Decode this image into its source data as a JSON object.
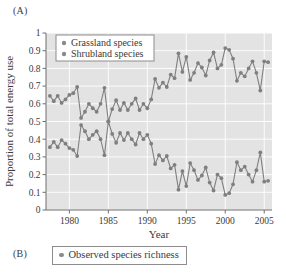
{
  "panels": {
    "a_label": "(A)",
    "b_label": "(B)"
  },
  "panel_b": {
    "legend": [
      {
        "label": "Observed species richness",
        "color": "#8a8a8a",
        "marker": "circle"
      }
    ]
  },
  "colors": {
    "series": "#7f7f7f",
    "plot_background": "#e3e3e3",
    "gridline": "#ffffff",
    "axis": "#6e6e6e",
    "text": "#3a3a3a",
    "legend_border": "#8d8d8d",
    "legend_background": "#ffffff"
  },
  "chart_data": {
    "type": "line",
    "title": "",
    "xlabel": "Year",
    "ylabel": "Proportion of total energy use",
    "xlim": [
      1977,
      2006
    ],
    "ylim": [
      0,
      1
    ],
    "xticks": [
      1980,
      1985,
      1990,
      1995,
      2000,
      2005
    ],
    "xticklabels": [
      "1980",
      "1985",
      "1990",
      "1995",
      "2000",
      "2005"
    ],
    "yticks": [
      0,
      0.1,
      0.2,
      0.3,
      0.4,
      0.5,
      0.6,
      0.7,
      0.8,
      0.9,
      1
    ],
    "yticklabels": [
      "0",
      "0.1",
      "0.2",
      "0.3",
      "0.4",
      "0.5",
      "0.6",
      "0.7",
      "0.8",
      "0.9",
      "1"
    ],
    "grid": true,
    "legend_position": "upper-left",
    "markers": "circle",
    "x": [
      1977.5,
      1978,
      1978.5,
      1979,
      1979.5,
      1980,
      1980.5,
      1981,
      1981.5,
      1982,
      1982.5,
      1983,
      1983.5,
      1984,
      1984.5,
      1985,
      1985.5,
      1986,
      1986.5,
      1987,
      1987.5,
      1988,
      1988.5,
      1989,
      1989.5,
      1990,
      1990.5,
      1991,
      1991.5,
      1992,
      1992.5,
      1993,
      1993.5,
      1994,
      1994.5,
      1995,
      1995.5,
      1996,
      1996.5,
      1997,
      1997.5,
      1998,
      1998.5,
      1999,
      1999.5,
      2000,
      2000.5,
      2001,
      2001.5,
      2002,
      2002.5,
      2003,
      2003.5,
      2004,
      2004.5,
      2005,
      2005.5
    ],
    "series": [
      {
        "name": "Grassland species",
        "color": "#7f7f7f",
        "values": [
          0.645,
          0.615,
          0.645,
          0.605,
          0.625,
          0.65,
          0.66,
          0.695,
          0.52,
          0.555,
          0.6,
          0.575,
          0.555,
          0.6,
          0.69,
          0.5,
          0.57,
          0.62,
          0.565,
          0.605,
          0.565,
          0.6,
          0.63,
          0.565,
          0.6,
          0.575,
          0.625,
          0.74,
          0.69,
          0.72,
          0.695,
          0.765,
          0.745,
          0.885,
          0.78,
          0.865,
          0.735,
          0.775,
          0.83,
          0.805,
          0.76,
          0.845,
          0.89,
          0.8,
          0.82,
          0.915,
          0.905,
          0.855,
          0.73,
          0.775,
          0.755,
          0.8,
          0.84,
          0.775,
          0.675,
          0.84,
          0.835
        ]
      },
      {
        "name": "Shrubland species",
        "color": "#7f7f7f",
        "values": [
          0.355,
          0.385,
          0.355,
          0.395,
          0.375,
          0.35,
          0.34,
          0.305,
          0.48,
          0.445,
          0.4,
          0.425,
          0.445,
          0.4,
          0.31,
          0.5,
          0.43,
          0.38,
          0.435,
          0.395,
          0.435,
          0.4,
          0.37,
          0.435,
          0.4,
          0.425,
          0.375,
          0.26,
          0.31,
          0.28,
          0.305,
          0.235,
          0.255,
          0.115,
          0.22,
          0.135,
          0.265,
          0.225,
          0.17,
          0.195,
          0.24,
          0.155,
          0.11,
          0.2,
          0.18,
          0.085,
          0.095,
          0.145,
          0.27,
          0.225,
          0.245,
          0.2,
          0.16,
          0.225,
          0.325,
          0.16,
          0.165
        ]
      }
    ]
  }
}
